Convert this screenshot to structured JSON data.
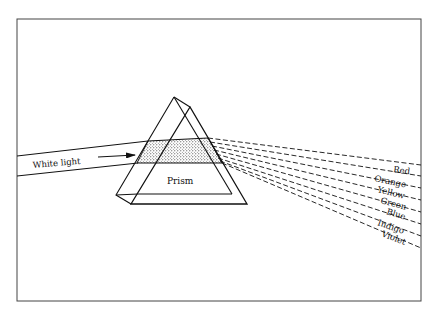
{
  "diagram": {
    "input_label": "White light",
    "prism_label": "Prism",
    "spectrum": [
      {
        "name": "Red"
      },
      {
        "name": "Orange"
      },
      {
        "name": "Yellow"
      },
      {
        "name": "Green"
      },
      {
        "name": "Blue"
      },
      {
        "name": "Indigo"
      },
      {
        "name": "Violet"
      }
    ]
  }
}
